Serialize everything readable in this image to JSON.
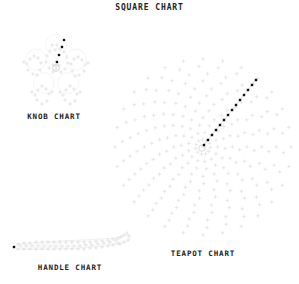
{
  "figure": {
    "title": "SQUARE CHART",
    "background_color": "#ffffff",
    "text_color": "#222222"
  },
  "panels": {
    "knob": {
      "label": "KNOB CHART"
    },
    "handle": {
      "label": "HANDLE CHART"
    },
    "teapot": {
      "label": "TEAPOT CHART"
    }
  },
  "chart_data": [
    {
      "type": "scatter",
      "name": "knob",
      "title": "KNOB CHART",
      "marker": "plus",
      "marker_color": "#d8d8d8",
      "highlight_marker": "square",
      "highlight_color": "#111111",
      "xlabel": "",
      "ylabel": "",
      "grid": false,
      "legend": "none",
      "xlim": [
        14,
        98
      ],
      "ylim": [
        28,
        108
      ],
      "description": "Five-lobed rosette point cloud of light plus markers with four dark square markers along upper-right lobe and a small ring at center.",
      "center": [
        56,
        66
      ],
      "lobe_count": 5,
      "lobe_radius": 21,
      "points": [
        [
          56,
          66
        ],
        [
          53,
          65
        ],
        [
          59,
          65
        ],
        [
          56,
          62
        ],
        [
          56,
          69
        ],
        [
          55,
          50
        ],
        [
          60,
          49
        ],
        [
          50,
          51
        ],
        [
          64,
          52
        ],
        [
          47,
          56
        ],
        [
          67,
          57
        ],
        [
          46,
          62
        ],
        [
          68,
          63
        ],
        [
          49,
          68
        ],
        [
          65,
          69
        ],
        [
          53,
          72
        ],
        [
          61,
          72
        ],
        [
          57,
          45
        ],
        [
          52,
          45
        ],
        [
          62,
          46
        ],
        [
          34,
          56
        ],
        [
          30,
          59
        ],
        [
          38,
          58
        ],
        [
          27,
          64
        ],
        [
          41,
          63
        ],
        [
          28,
          70
        ],
        [
          40,
          70
        ],
        [
          33,
          74
        ],
        [
          37,
          75
        ],
        [
          24,
          62
        ],
        [
          78,
          57
        ],
        [
          82,
          60
        ],
        [
          74,
          59
        ],
        [
          85,
          65
        ],
        [
          71,
          64
        ],
        [
          84,
          71
        ],
        [
          72,
          71
        ],
        [
          79,
          75
        ],
        [
          75,
          76
        ],
        [
          88,
          63
        ],
        [
          42,
          86
        ],
        [
          38,
          90
        ],
        [
          46,
          89
        ],
        [
          35,
          95
        ],
        [
          49,
          94
        ],
        [
          37,
          100
        ],
        [
          47,
          101
        ],
        [
          42,
          104
        ],
        [
          32,
          92
        ],
        [
          52,
          92
        ],
        [
          70,
          86
        ],
        [
          66,
          90
        ],
        [
          74,
          89
        ],
        [
          63,
          95
        ],
        [
          77,
          94
        ],
        [
          65,
          100
        ],
        [
          75,
          101
        ],
        [
          70,
          104
        ],
        [
          60,
          92
        ],
        [
          80,
          92
        ]
      ],
      "highlight_points": [
        [
          64,
          40
        ],
        [
          62,
          47
        ],
        [
          59,
          55
        ],
        [
          57,
          62
        ]
      ]
    },
    {
      "type": "scatter",
      "name": "handle",
      "title": "HANDLE CHART",
      "marker": "plus",
      "marker_color": "#d8d8d8",
      "highlight_marker": "square",
      "highlight_color": "#111111",
      "xlabel": "",
      "ylabel": "",
      "grid": false,
      "legend": "none",
      "xlim": [
        12,
        132
      ],
      "ylim": [
        233,
        258
      ],
      "description": "Elongated horizontal tube of plus markers sweeping left to right, curling upward into a hook at the right end; single dark square marker at far left tip.",
      "points": [
        [
          18,
          244
        ],
        [
          24,
          243
        ],
        [
          30,
          243
        ],
        [
          36,
          242
        ],
        [
          42,
          242
        ],
        [
          48,
          242
        ],
        [
          54,
          242
        ],
        [
          60,
          242
        ],
        [
          66,
          242
        ],
        [
          72,
          242
        ],
        [
          78,
          242
        ],
        [
          84,
          242
        ],
        [
          90,
          242
        ],
        [
          96,
          241
        ],
        [
          102,
          241
        ],
        [
          108,
          240
        ],
        [
          113,
          239
        ],
        [
          118,
          238
        ],
        [
          18,
          249
        ],
        [
          24,
          249
        ],
        [
          30,
          249
        ],
        [
          36,
          249
        ],
        [
          42,
          249
        ],
        [
          48,
          249
        ],
        [
          54,
          249
        ],
        [
          60,
          249
        ],
        [
          66,
          249
        ],
        [
          72,
          249
        ],
        [
          78,
          249
        ],
        [
          84,
          249
        ],
        [
          90,
          248
        ],
        [
          96,
          248
        ],
        [
          102,
          247
        ],
        [
          108,
          246
        ],
        [
          113,
          245
        ],
        [
          118,
          243
        ],
        [
          20,
          246
        ],
        [
          26,
          246
        ],
        [
          32,
          246
        ],
        [
          38,
          246
        ],
        [
          44,
          246
        ],
        [
          50,
          246
        ],
        [
          56,
          246
        ],
        [
          62,
          246
        ],
        [
          68,
          246
        ],
        [
          74,
          246
        ],
        [
          80,
          246
        ],
        [
          86,
          245
        ],
        [
          92,
          245
        ],
        [
          98,
          244
        ],
        [
          104,
          243
        ],
        [
          110,
          242
        ],
        [
          116,
          240
        ],
        [
          121,
          237
        ],
        [
          124,
          235
        ],
        [
          127,
          233
        ],
        [
          129,
          236
        ],
        [
          128,
          240
        ],
        [
          124,
          242
        ],
        [
          120,
          244
        ]
      ],
      "highlight_points": [
        [
          14,
          247
        ]
      ]
    },
    {
      "type": "scatter",
      "name": "teapot",
      "title": "TEAPOT CHART",
      "marker": "plus",
      "marker_color": "#dcdcdc",
      "highlight_marker": "square",
      "highlight_color": "#111111",
      "xlabel": "",
      "ylabel": "",
      "grid": false,
      "legend": "none",
      "projection": "polar",
      "center": [
        203,
        147
      ],
      "radius": 88,
      "ring_count": 12,
      "spoke_count": 28,
      "xlim": [
        113,
        293
      ],
      "ylim": [
        57,
        237
      ],
      "description": "Large circular polar grid of light plus markers arranged in 12 concentric rings by 28 spokes; a dark series of square markers runs diagonally from the center toward the upper-right rim.",
      "highlight_points": [
        [
          204,
          145
        ],
        [
          208,
          140
        ],
        [
          212,
          135
        ],
        [
          216,
          130
        ],
        [
          220,
          125
        ],
        [
          224,
          120
        ],
        [
          228,
          115
        ],
        [
          232,
          110
        ],
        [
          236,
          105
        ],
        [
          240,
          100
        ],
        [
          244,
          95
        ],
        [
          248,
          90
        ],
        [
          252,
          85
        ],
        [
          256,
          80
        ]
      ],
      "highlight_series": {
        "name": "spout-profile",
        "angle_deg": 45,
        "radial_start": 2,
        "radial_end": 86,
        "count": 14
      }
    },
    {
      "type": "scatter",
      "name": "square",
      "title": "SQUARE CHART",
      "description": "Overall figure title for the composite four-panel square chart layout."
    }
  ]
}
